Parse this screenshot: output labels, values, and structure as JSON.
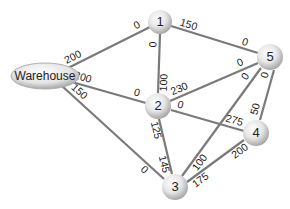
{
  "diagram": {
    "type": "network-flow",
    "nodes": [
      {
        "id": "W",
        "label": "Warehouse"
      },
      {
        "id": "1",
        "label": "1"
      },
      {
        "id": "2",
        "label": "2"
      },
      {
        "id": "3",
        "label": "3"
      },
      {
        "id": "4",
        "label": "4"
      },
      {
        "id": "5",
        "label": "5"
      }
    ],
    "edges": [
      {
        "from": "W",
        "to": "1",
        "from_label": "200",
        "to_label": "0"
      },
      {
        "from": "W",
        "to": "2",
        "from_label": "200",
        "to_label": "0"
      },
      {
        "from": "W",
        "to": "3",
        "from_label": "150",
        "to_label": "0"
      },
      {
        "from": "1",
        "to": "5",
        "from_label": "150",
        "to_label": "0"
      },
      {
        "from": "1",
        "to": "2",
        "from_label": "0",
        "to_label": "100"
      },
      {
        "from": "2",
        "to": "5",
        "from_label": "230",
        "to_label": "0"
      },
      {
        "from": "2",
        "to": "4",
        "from_label": "0",
        "to_label": "275"
      },
      {
        "from": "2",
        "to": "3",
        "from_label": "125",
        "to_label": "145"
      },
      {
        "from": "5",
        "to": "3",
        "from_label": "0",
        "to_label": "100"
      },
      {
        "from": "5",
        "to": "4",
        "from_label": "0",
        "to_label": "50"
      },
      {
        "from": "4",
        "to": "3",
        "from_label": "200",
        "to_label": "175"
      }
    ]
  }
}
